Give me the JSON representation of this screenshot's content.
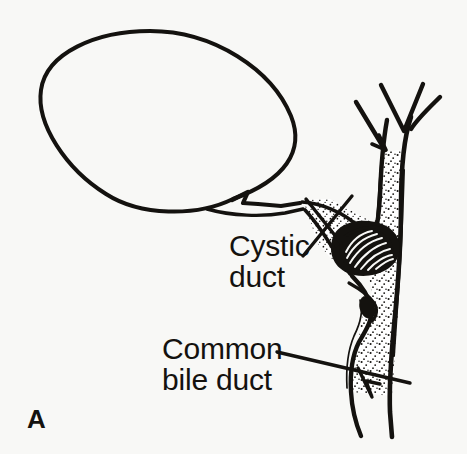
{
  "figure": {
    "panel_label": "A",
    "background_color": "#f8f8f6",
    "ink_color": "#14120f",
    "width": 467,
    "height": 454
  },
  "annotations": {
    "cystic_duct": {
      "line1": "Cystic",
      "line2": "duct"
    },
    "common_bile_duct": {
      "line1": "Common",
      "line2": "bile duct"
    }
  },
  "structures": {
    "gallbladder": "gallbladder-outline",
    "gallbladder_neck": "gallbladder-neck",
    "cystic_duct": "cystic-duct",
    "common_bile_duct": "common-bile-duct",
    "hepatic_duct_bifurcation": "hepatic-duct-bifurcation",
    "impacted_stone": "impacted-stone"
  }
}
